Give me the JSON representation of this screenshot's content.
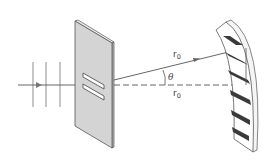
{
  "diagram": {
    "labels": {
      "r0_upper": "r",
      "r0_upper_sub": "0",
      "r0_lower": "r",
      "r0_lower_sub": "0",
      "theta": "θ"
    },
    "elements": {
      "incident_wavefronts": 3,
      "slits": 2,
      "fringes_dark": 6
    },
    "colors": {
      "barrier_fill": "#d4d4d4",
      "barrier_edge": "#555555",
      "wavefront": "#b5b5b5",
      "ray": "#555555",
      "fringe_dark": "#3a3a3a",
      "screen_fill": "#ffffff"
    }
  }
}
